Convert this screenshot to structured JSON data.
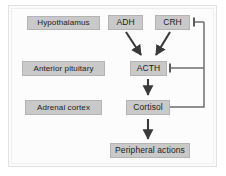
{
  "figure": {
    "background_color": "#fcfcfc",
    "box_fill_color": "#c9c9c9",
    "box_border_color": "#b4b4b4",
    "arrow_color": "#3a3a3a",
    "feedback_line_color": "#6e6e6e"
  },
  "tissue_labels": [
    {
      "id": "hypothalamus",
      "label": "Hypothalamus"
    },
    {
      "id": "anterior-pituitary",
      "label": "Anterior pituitary"
    },
    {
      "id": "adrenal-cortex",
      "label": "Adrenal cortex"
    }
  ],
  "nodes": [
    {
      "id": "adh",
      "label": "ADH"
    },
    {
      "id": "crh",
      "label": "CRH"
    },
    {
      "id": "acth",
      "label": "ACTH"
    },
    {
      "id": "cortisol",
      "label": "Cortisol"
    },
    {
      "id": "peripheral-actions",
      "label": "Peripheral actions"
    }
  ],
  "edges": [
    {
      "from": "adh",
      "to": "acth",
      "type": "stimulatory-arrow"
    },
    {
      "from": "crh",
      "to": "acth",
      "type": "stimulatory-arrow"
    },
    {
      "from": "acth",
      "to": "cortisol",
      "type": "stimulatory-arrow"
    },
    {
      "from": "cortisol",
      "to": "peripheral-actions",
      "type": "stimulatory-arrow"
    },
    {
      "from": "cortisol",
      "to": "acth",
      "type": "inhibitory-tbar"
    },
    {
      "from": "cortisol",
      "to": "crh",
      "type": "inhibitory-tbar"
    }
  ]
}
